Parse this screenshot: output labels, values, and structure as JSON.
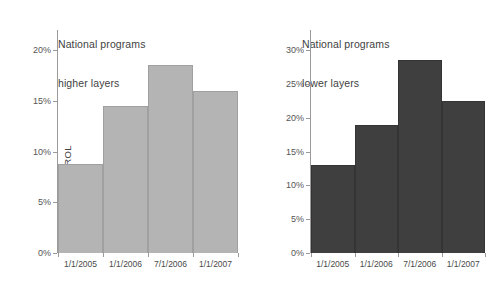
{
  "chart_data": [
    {
      "id": "higher-layers",
      "type": "bar",
      "title": "National programs\nhigher layers",
      "title_line1": "National programs",
      "title_line2": "higher layers",
      "xlabel": "",
      "ylabel": "ROL",
      "categories": [
        "1/1/2005",
        "1/1/2006",
        "7/1/2006",
        "1/1/2007"
      ],
      "values": [
        8.8,
        14.5,
        18.5,
        16.0
      ],
      "ylim": [
        0,
        22
      ],
      "yticks": [
        0,
        5,
        10,
        15,
        20
      ],
      "ytick_labels": [
        "0%",
        "5%",
        "10%",
        "15%",
        "20%"
      ],
      "grid": false,
      "legend": "none",
      "bar_color": "#b4b4b4",
      "bar_edge_color": "#a0a0a0",
      "axis_color": "#9a9a9a"
    },
    {
      "id": "lower-layers",
      "type": "bar",
      "title": "National programs\nlower layers",
      "title_line1": "National programs",
      "title_line2": "lower layers",
      "xlabel": "",
      "ylabel": "",
      "categories": [
        "1/1/2005",
        "1/1/2006",
        "7/1/2006",
        "1/1/2007"
      ],
      "values": [
        13.0,
        19.0,
        28.6,
        22.5
      ],
      "ylim": [
        0,
        33
      ],
      "yticks": [
        0,
        5,
        10,
        15,
        20,
        25,
        30
      ],
      "ytick_labels": [
        "0%",
        "5%",
        "10%",
        "15%",
        "20%",
        "25%",
        "30%"
      ],
      "grid": false,
      "legend": "none",
      "bar_color": "#3f3f3f",
      "bar_edge_color": "#343434",
      "axis_color": "#9a9a9a"
    }
  ],
  "figure": {
    "background": "#ffffff",
    "text_color": "#4a4a4a"
  }
}
